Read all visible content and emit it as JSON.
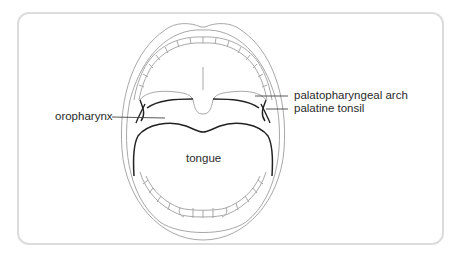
{
  "diagram": {
    "type": "anatomical illustration",
    "labels": {
      "oropharynx": "oropharynx",
      "palatopharyngeal_arch": "palatopharyngeal arch",
      "palatine_tonsil": "palatine tonsil",
      "tongue": "tongue"
    },
    "colors": {
      "outline_light": "#a8a8a8",
      "outline_dark": "#222222",
      "leader_line": "#444444",
      "frame_border": "#dcdcdc"
    }
  }
}
